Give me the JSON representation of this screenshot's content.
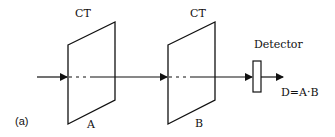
{
  "figure": {
    "panel_label": "(a)",
    "plate_a": {
      "top_label": "CT",
      "bottom_label": "A"
    },
    "plate_b": {
      "top_label": "CT",
      "bottom_label": "B"
    },
    "detector": {
      "label": "Detector"
    },
    "output_label": "D=A·B",
    "line_color": "#111111"
  }
}
